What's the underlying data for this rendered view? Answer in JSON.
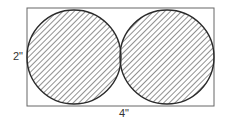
{
  "diagram": {
    "shape": "rectangle containing two tangent circles",
    "rectangle": {
      "x": 27,
      "y": 8,
      "width": 187,
      "height": 98
    },
    "circles": [
      {
        "cx": 74,
        "cy": 57,
        "r": 47,
        "fill": "hatched"
      },
      {
        "cx": 167,
        "cy": 57,
        "r": 47,
        "fill": "hatched"
      }
    ],
    "labels": {
      "height": "2\"",
      "width": "4\""
    },
    "colors": {
      "stroke": "#2a2a2a",
      "rect_stroke": "#555555",
      "hatch": "#555555",
      "background": "#ffffff"
    }
  }
}
